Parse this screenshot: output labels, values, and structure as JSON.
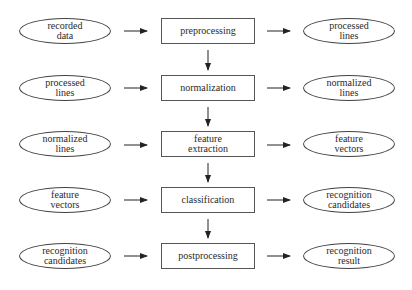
{
  "diagram": {
    "type": "flowchart",
    "stages": [
      {
        "input": "recorded\ndata",
        "process": "preprocessing",
        "output": "processed\nlines"
      },
      {
        "input": "processed\nlines",
        "process": "normalization",
        "output": "normalized\nlines"
      },
      {
        "input": "normalized\nlines",
        "process": "feature\nextraction",
        "output": "feature\nvectors"
      },
      {
        "input": "feature\nvectors",
        "process": "classification",
        "output": "recognition\ncandidates"
      },
      {
        "input": "recognition\ncandidates",
        "process": "postprocessing",
        "output": "recognition\nresult"
      }
    ]
  }
}
